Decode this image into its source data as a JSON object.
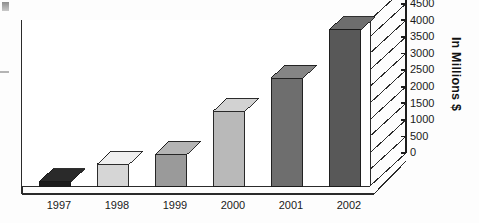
{
  "chart_data": {
    "type": "bar",
    "title": "",
    "xlabel": "",
    "ylabel": "In Millions $",
    "categories": [
      "1997",
      "1998",
      "1999",
      "2000",
      "2001",
      "2002"
    ],
    "values": [
      125,
      650,
      950,
      2250,
      3250,
      4700
    ],
    "ylim": [
      0,
      5000
    ],
    "ytick_labels": [
      "0",
      "500",
      "1000",
      "1500",
      "2000",
      "2500",
      "3000",
      "3500",
      "4000",
      "4500",
      "5000"
    ],
    "ytick_values": [
      0,
      500,
      1000,
      1500,
      2000,
      2500,
      3000,
      3500,
      4000,
      4500,
      5000
    ],
    "grid": true,
    "legend": "none",
    "y_axis_position": "right",
    "style": "3d-bar-grayscale",
    "bar_colors": [
      "#1c1c1c",
      "#d6d6d6",
      "#9a9a9a",
      "#b9b9b9",
      "#6e6e6e",
      "#585858"
    ],
    "bar_side_colors": [
      "#0e0e0e",
      "#9d9d9d",
      "#6d6d6d",
      "#8a8a8a",
      "#4e4e4e",
      "#3d3d3d"
    ],
    "bar_top_colors": [
      "#2a2a2a",
      "#efefef",
      "#b4b4b4",
      "#d2d2d2",
      "#858585",
      "#6e6e6e"
    ]
  },
  "labels": {
    "axis_title": "In Millions $"
  }
}
